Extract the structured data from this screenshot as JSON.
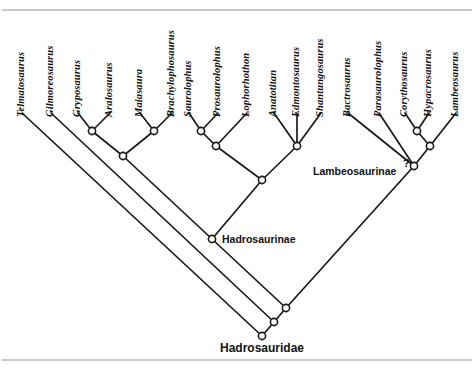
{
  "figure": {
    "background_color": "#ffffff",
    "line_color": "#1a1a1a",
    "frame_color": "#b9b9b9"
  },
  "taxa": [
    {
      "name": "Telmatosaurus",
      "tip_x": 22,
      "tip_y": 113
    },
    {
      "name": "Gilmoreosaurus",
      "tip_x": 51,
      "tip_y": 113
    },
    {
      "name": "Gryposaurus",
      "tip_x": 78,
      "tip_y": 113
    },
    {
      "name": "Aralosaurus",
      "tip_x": 110,
      "tip_y": 113
    },
    {
      "name": "Maiasaura",
      "tip_x": 140,
      "tip_y": 113
    },
    {
      "name": "Brachylophosaurus",
      "tip_x": 172,
      "tip_y": 113
    },
    {
      "name": "Saurolophus",
      "tip_x": 189,
      "tip_y": 113
    },
    {
      "name": "Prosaurolophus",
      "tip_x": 218,
      "tip_y": 113
    },
    {
      "name": "Lophorhothon",
      "tip_x": 247,
      "tip_y": 113
    },
    {
      "name": "Anatotitan",
      "tip_x": 274,
      "tip_y": 113
    },
    {
      "name": "Edmontosaurus",
      "tip_x": 297,
      "tip_y": 113
    },
    {
      "name": "Shantungosaurus",
      "tip_x": 321,
      "tip_y": 113
    },
    {
      "name": "Bactrosaurus",
      "tip_x": 348,
      "tip_y": 113
    },
    {
      "name": "Parasaurolophus",
      "tip_x": 379,
      "tip_y": 113
    },
    {
      "name": "Corythosaurus",
      "tip_x": 405,
      "tip_y": 113
    },
    {
      "name": "Hypacrosaurus",
      "tip_x": 429,
      "tip_y": 113
    },
    {
      "name": "Lambeosaurus",
      "tip_x": 456,
      "tip_y": 113
    }
  ],
  "clade_labels": [
    {
      "text": "Lambeosaurinae",
      "x": 313,
      "y": 165,
      "size": "normal"
    },
    {
      "text": "Hadrosaurinae",
      "x": 222,
      "y": 233,
      "size": "normal"
    },
    {
      "text": "Hadrosauridae",
      "x": 220,
      "y": 341,
      "size": "big"
    }
  ],
  "uncertainty_marker": {
    "symbol": "?",
    "x": 403,
    "y": 157
  },
  "nodes": [
    {
      "id": "n-gryposaurus-aralosaurus",
      "x": 92,
      "y": 131
    },
    {
      "id": "n-maiasaura-brachylopho",
      "x": 154,
      "y": 131
    },
    {
      "id": "n-brachylophosaurini",
      "x": 123,
      "y": 156
    },
    {
      "id": "n-saurolophus-prosaurolophus",
      "x": 201,
      "y": 131
    },
    {
      "id": "n-saurolophini",
      "x": 216,
      "y": 146
    },
    {
      "id": "n-edmontosaurini",
      "x": 297,
      "y": 146
    },
    {
      "id": "n-hadrosaurine-crown",
      "x": 262,
      "y": 180
    },
    {
      "id": "n-hadrosaurinae",
      "x": 212,
      "y": 239
    },
    {
      "id": "n-corytho-hypacro",
      "x": 417,
      "y": 131
    },
    {
      "id": "n-lambeosaurini",
      "x": 430,
      "y": 146
    },
    {
      "id": "n-lambeosaurinae",
      "x": 414,
      "y": 166
    },
    {
      "id": "n-hadrosauridae-crown",
      "x": 286,
      "y": 308
    },
    {
      "id": "n-node-gilmoreosaurus",
      "x": 274,
      "y": 322
    },
    {
      "id": "n-hadrosauridae-root",
      "x": 262,
      "y": 336
    }
  ],
  "branches": [
    {
      "from_x": 22,
      "from_y": 113,
      "to_x": 262,
      "to_y": 336,
      "tip": "Telmatosaurus"
    },
    {
      "from_x": 51,
      "from_y": 113,
      "to_x": 274,
      "to_y": 322,
      "tip": "Gilmoreosaurus"
    },
    {
      "from_x": 78,
      "from_y": 113,
      "to_x": 92,
      "to_y": 131,
      "tip": "Gryposaurus"
    },
    {
      "from_x": 110,
      "from_y": 113,
      "to_x": 92,
      "to_y": 131,
      "tip": "Aralosaurus"
    },
    {
      "from_x": 140,
      "from_y": 113,
      "to_x": 154,
      "to_y": 131,
      "tip": "Maiasaura"
    },
    {
      "from_x": 172,
      "from_y": 113,
      "to_x": 154,
      "to_y": 131,
      "tip": "Brachylophosaurus"
    },
    {
      "from_x": 92,
      "from_y": 131,
      "to_x": 123,
      "to_y": 156,
      "tip": ""
    },
    {
      "from_x": 154,
      "from_y": 131,
      "to_x": 123,
      "to_y": 156,
      "tip": ""
    },
    {
      "from_x": 123,
      "from_y": 156,
      "to_x": 212,
      "to_y": 239,
      "tip": ""
    },
    {
      "from_x": 189,
      "from_y": 113,
      "to_x": 201,
      "to_y": 131,
      "tip": "Saurolophus"
    },
    {
      "from_x": 218,
      "from_y": 113,
      "to_x": 201,
      "to_y": 131,
      "tip": "Prosaurolophus"
    },
    {
      "from_x": 201,
      "from_y": 131,
      "to_x": 216,
      "to_y": 146,
      "tip": ""
    },
    {
      "from_x": 247,
      "from_y": 113,
      "to_x": 216,
      "to_y": 146,
      "tip": "Lophorhothon"
    },
    {
      "from_x": 216,
      "from_y": 146,
      "to_x": 262,
      "to_y": 180,
      "tip": ""
    },
    {
      "from_x": 274,
      "from_y": 113,
      "to_x": 297,
      "to_y": 146,
      "tip": "Anatotitan"
    },
    {
      "from_x": 297,
      "from_y": 113,
      "to_x": 297,
      "to_y": 146,
      "tip": "Edmontosaurus"
    },
    {
      "from_x": 321,
      "from_y": 113,
      "to_x": 297,
      "to_y": 146,
      "tip": "Shantungosaurus"
    },
    {
      "from_x": 297,
      "from_y": 146,
      "to_x": 262,
      "to_y": 180,
      "tip": ""
    },
    {
      "from_x": 262,
      "from_y": 180,
      "to_x": 212,
      "to_y": 239,
      "tip": ""
    },
    {
      "from_x": 212,
      "from_y": 239,
      "to_x": 286,
      "to_y": 308,
      "tip": ""
    },
    {
      "from_x": 348,
      "from_y": 113,
      "to_x": 414,
      "to_y": 166,
      "tip": "Bactrosaurus"
    },
    {
      "from_x": 379,
      "from_y": 113,
      "to_x": 414,
      "to_y": 166,
      "tip": "Parasaurolophus"
    },
    {
      "from_x": 405,
      "from_y": 113,
      "to_x": 417,
      "to_y": 131,
      "tip": "Corythosaurus"
    },
    {
      "from_x": 429,
      "from_y": 113,
      "to_x": 417,
      "to_y": 131,
      "tip": "Hypacrosaurus"
    },
    {
      "from_x": 417,
      "from_y": 131,
      "to_x": 430,
      "to_y": 146,
      "tip": ""
    },
    {
      "from_x": 456,
      "from_y": 113,
      "to_x": 430,
      "to_y": 146,
      "tip": "Lambeosaurus"
    },
    {
      "from_x": 430,
      "from_y": 146,
      "to_x": 414,
      "to_y": 166,
      "tip": ""
    },
    {
      "from_x": 414,
      "from_y": 166,
      "to_x": 286,
      "to_y": 308,
      "tip": ""
    },
    {
      "from_x": 286,
      "from_y": 308,
      "to_x": 274,
      "to_y": 322,
      "tip": ""
    },
    {
      "from_x": 274,
      "from_y": 322,
      "to_x": 262,
      "to_y": 336,
      "tip": ""
    }
  ],
  "frame": {
    "top_line_y": 10,
    "bottom_line_y": 360,
    "left_x": 2,
    "right_x": 472
  }
}
